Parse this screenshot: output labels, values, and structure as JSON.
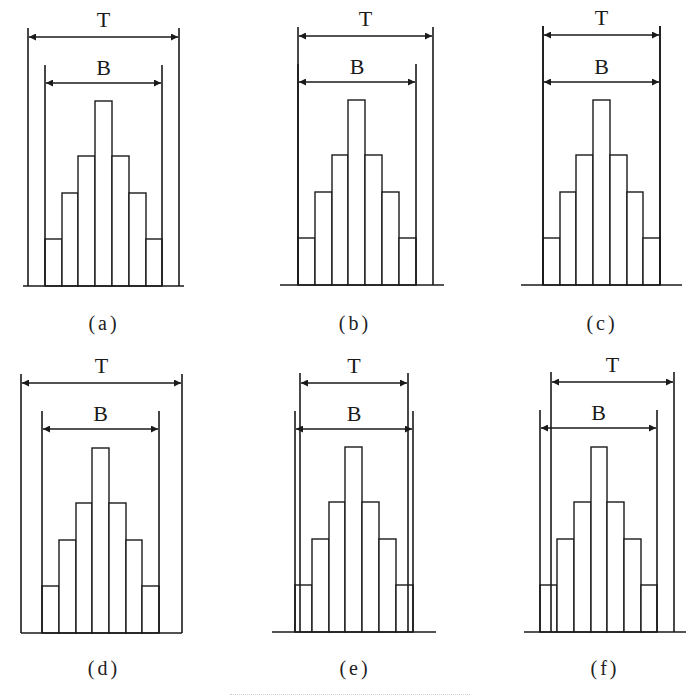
{
  "figure": {
    "stroke_color": "#1a1a1a",
    "background": "#ffffff",
    "bar_relative_heights": [
      47,
      93,
      130,
      185,
      130,
      93,
      47
    ],
    "panels": [
      {
        "id": "a",
        "caption": "(a)",
        "caption_x": 104,
        "caption_y": 330,
        "baseline": {
          "y": 286,
          "x1": 23,
          "x2": 184
        },
        "T": {
          "label": "T",
          "x1": 28,
          "x2": 179,
          "top": 28,
          "arrow_y": 37,
          "label_y": 27
        },
        "B": {
          "label": "B",
          "x1": 45,
          "x2": 162,
          "top": 65,
          "arrow_y": 83,
          "label_y": 75
        },
        "bars_x": [
          45,
          62,
          78,
          95,
          112,
          129,
          146,
          162
        ]
      },
      {
        "id": "b",
        "caption": "(b)",
        "caption_x": 355,
        "caption_y": 330,
        "baseline": {
          "y": 285,
          "x1": 280,
          "x2": 444
        },
        "T": {
          "label": "T",
          "x1": 298,
          "x2": 433,
          "top": 27,
          "arrow_y": 36,
          "label_y": 26
        },
        "B": {
          "label": "B",
          "x1": 298,
          "x2": 416,
          "top": 64,
          "arrow_y": 82,
          "label_y": 74
        },
        "bars_x": [
          298,
          315,
          332,
          348,
          365,
          382,
          399,
          416
        ]
      },
      {
        "id": "c",
        "caption": "(c)",
        "caption_x": 602,
        "caption_y": 330,
        "baseline": {
          "y": 285,
          "x1": 521,
          "x2": 682
        },
        "T": {
          "label": "T",
          "x1": 543,
          "x2": 660,
          "top": 26,
          "arrow_y": 35,
          "label_y": 25
        },
        "B": {
          "label": "B",
          "x1": 543,
          "x2": 660,
          "top": 26,
          "arrow_y": 82,
          "label_y": 74
        },
        "bars_x": [
          543,
          560,
          576,
          593,
          610,
          627,
          643,
          660
        ]
      },
      {
        "id": "d",
        "caption": "(d)",
        "caption_x": 104,
        "caption_y": 675,
        "baseline": {
          "y": 633,
          "x1": 21,
          "x2": 182
        },
        "T": {
          "label": "T",
          "x1": 21,
          "x2": 182,
          "top": 374,
          "arrow_y": 383,
          "label_y": 373
        },
        "B": {
          "label": "B",
          "x1": 42,
          "x2": 159,
          "top": 411,
          "arrow_y": 429,
          "label_y": 421
        },
        "bars_x": [
          42,
          59,
          76,
          92,
          109,
          126,
          142,
          159
        ]
      },
      {
        "id": "e",
        "caption": "(e)",
        "caption_x": 355,
        "caption_y": 675,
        "baseline": {
          "y": 632,
          "x1": 272,
          "x2": 436
        },
        "T": {
          "label": "T",
          "x1": 300,
          "x2": 408,
          "top": 373,
          "arrow_y": 383,
          "label_y": 373
        },
        "B": {
          "label": "B",
          "x1": 295,
          "x2": 413,
          "top": 411,
          "arrow_y": 429,
          "label_y": 421
        },
        "bars_x": [
          295,
          312,
          329,
          345,
          362,
          379,
          396,
          413
        ]
      },
      {
        "id": "f",
        "caption": "(f)",
        "caption_x": 605,
        "caption_y": 675,
        "baseline": {
          "y": 632,
          "x1": 524,
          "x2": 686
        },
        "T": {
          "label": "T",
          "x1": 551,
          "x2": 674,
          "top": 372,
          "arrow_y": 382,
          "label_y": 372
        },
        "B": {
          "label": "B",
          "x1": 540,
          "x2": 657,
          "top": 410,
          "arrow_y": 428,
          "label_y": 420
        },
        "bars_x": [
          540,
          557,
          574,
          591,
          607,
          624,
          641,
          657
        ]
      }
    ]
  }
}
